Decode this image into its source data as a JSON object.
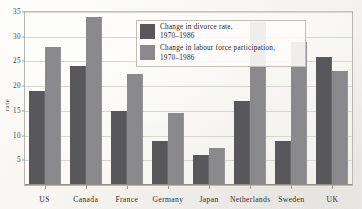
{
  "chart_data": {
    "type": "bar",
    "title": "",
    "xlabel": "",
    "ylabel": "rate",
    "ylim": [
      0,
      35
    ],
    "yticks": [
      5,
      10,
      15,
      20,
      25,
      30,
      35
    ],
    "grid": true,
    "legend_position": "top-center-inside",
    "categories": [
      "US",
      "Canada",
      "France",
      "Germany",
      "Japan",
      "Netherlands",
      "Sweden",
      "UK"
    ],
    "series": [
      {
        "name": "Change in divorce rate, 1970–1986",
        "color": "#58585a",
        "values": [
          19,
          24,
          15,
          9,
          6,
          17,
          9,
          26
        ]
      },
      {
        "name": "Change in labour force participation, 1970–1986",
        "color": "#8a8a8c",
        "values": [
          28,
          34,
          22.5,
          14.5,
          7.5,
          33,
          29,
          23
        ]
      }
    ]
  },
  "legend": {
    "items": [
      {
        "line1": "Change in divorce rate,",
        "line2": "1970–1986",
        "swatch": "dark"
      },
      {
        "line1": "Change in labour force participation,",
        "line2": "1970–1986",
        "swatch": "light"
      }
    ]
  },
  "axis": {
    "y_label": "rate",
    "y_ticks": [
      "5",
      "10",
      "15",
      "20",
      "25",
      "30",
      "35"
    ],
    "x_ticks": [
      "US",
      "Canada",
      "France",
      "Germany",
      "Japan",
      "Netherlands",
      "Sweden",
      "UK"
    ]
  }
}
